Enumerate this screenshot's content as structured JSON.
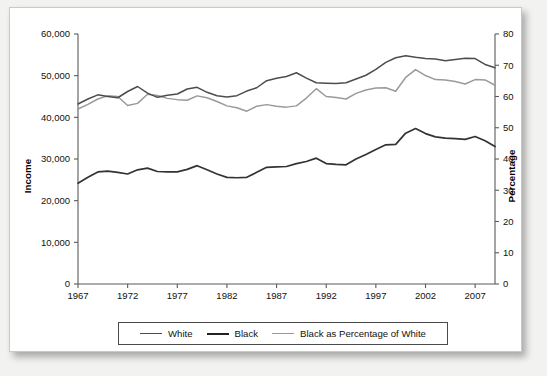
{
  "chart_data": {
    "type": "line",
    "title": "",
    "xlabel": "",
    "ylabel": "Income",
    "y2label": "Percentage",
    "xlim": [
      1967,
      2009
    ],
    "ylim": [
      0,
      60000
    ],
    "y2lim": [
      0,
      80
    ],
    "grid": false,
    "legend_position": "bottom",
    "x_ticks": [
      "1967",
      "1972",
      "1977",
      "1982",
      "1987",
      "1992",
      "1997",
      "2002",
      "2007"
    ],
    "y_ticks": [
      "0",
      "10,000",
      "20,000",
      "30,000",
      "40,000",
      "50,000",
      "60,000"
    ],
    "y2_ticks": [
      "0",
      "10",
      "20",
      "30",
      "40",
      "50",
      "60",
      "70",
      "80"
    ],
    "x": [
      1967,
      1968,
      1969,
      1970,
      1971,
      1972,
      1973,
      1974,
      1975,
      1976,
      1977,
      1978,
      1979,
      1980,
      1981,
      1982,
      1983,
      1984,
      1985,
      1986,
      1987,
      1988,
      1989,
      1990,
      1991,
      1992,
      1993,
      1994,
      1995,
      1996,
      1997,
      1998,
      1999,
      2000,
      2001,
      2002,
      2003,
      2004,
      2005,
      2006,
      2007,
      2008,
      2009
    ],
    "series": [
      {
        "name": "White",
        "axis": "left",
        "color": "#4d4d4d",
        "values": [
          43200,
          44400,
          45400,
          45000,
          44700,
          46200,
          47400,
          45800,
          44800,
          45300,
          45600,
          46800,
          47200,
          46000,
          45200,
          44900,
          45200,
          46300,
          47100,
          48800,
          49400,
          49800,
          50700,
          49400,
          48300,
          48200,
          48100,
          48300,
          49200,
          50100,
          51500,
          53200,
          54300,
          54800,
          54400,
          54100,
          54000,
          53600,
          53900,
          54200,
          54100,
          52700,
          51900
        ]
      },
      {
        "name": "Black",
        "axis": "left",
        "color": "#333333",
        "values": [
          24200,
          25600,
          26900,
          27100,
          26800,
          26400,
          27400,
          27800,
          27000,
          26900,
          26900,
          27500,
          28400,
          27400,
          26400,
          25600,
          25500,
          25600,
          26800,
          28000,
          28100,
          28200,
          28900,
          29400,
          30200,
          28900,
          28700,
          28600,
          30000,
          31100,
          32300,
          33400,
          33500,
          36200,
          37300,
          36100,
          35300,
          35000,
          34900,
          34700,
          35400,
          34400,
          33000
        ]
      },
      {
        "name": "Black as Percentage of White",
        "axis": "right",
        "color": "#9a9a9a",
        "values": [
          56.0,
          57.5,
          59.2,
          60.2,
          60.0,
          57.1,
          57.8,
          60.7,
          60.3,
          59.4,
          59.0,
          58.8,
          60.2,
          59.6,
          58.4,
          57.0,
          56.4,
          55.3,
          56.9,
          57.4,
          56.9,
          56.6,
          57.0,
          59.5,
          62.5,
          60.0,
          59.7,
          59.2,
          61.0,
          62.1,
          62.7,
          62.8,
          61.7,
          66.1,
          68.6,
          66.7,
          65.4,
          65.3,
          64.8,
          64.0,
          65.4,
          65.3,
          63.6
        ]
      }
    ]
  },
  "axes": {
    "left_title": "Income",
    "right_title": "Percentage"
  },
  "legend": {
    "items": [
      {
        "label": "White",
        "swatch": "line-swatch-white"
      },
      {
        "label": "Black",
        "swatch": "line-swatch-black"
      },
      {
        "label": "Black as Percentage of White",
        "swatch": "line-swatch-percentage"
      }
    ]
  }
}
